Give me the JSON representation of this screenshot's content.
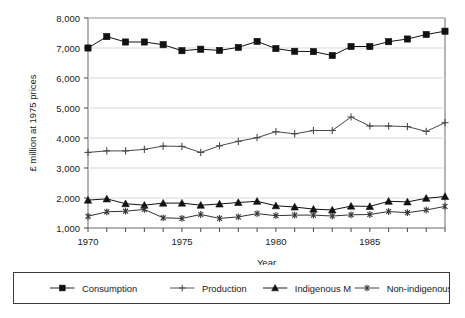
{
  "chart_data": {
    "type": "line",
    "title": "",
    "xlabel": "Year",
    "ylabel": "£ million at 1975 prices",
    "xlim": [
      1970,
      1989
    ],
    "ylim": [
      1000,
      8000
    ],
    "ytick_labels": [
      "1,000",
      "2,000",
      "3,000",
      "4,000",
      "5,000",
      "6,000",
      "7,000",
      "8,000"
    ],
    "yticks": [
      1000,
      2000,
      3000,
      4000,
      5000,
      6000,
      7000,
      8000
    ],
    "xtick_labels": [
      "1970",
      "1975",
      "1980",
      "1985"
    ],
    "xticks": [
      1970,
      1975,
      1980,
      1985
    ],
    "x": [
      1970,
      1971,
      1972,
      1973,
      1974,
      1975,
      1976,
      1977,
      1978,
      1979,
      1980,
      1981,
      1982,
      1983,
      1984,
      1985,
      1986,
      1987,
      1988,
      1989
    ],
    "grid": "horizontal",
    "legend_position": "bottom",
    "series": [
      {
        "name": "Consumption",
        "marker": "square",
        "color": "#111111",
        "values": [
          7000,
          7380,
          7200,
          7200,
          7110,
          6910,
          6960,
          6920,
          7020,
          7220,
          6980,
          6890,
          6880,
          6750,
          7050,
          7050,
          7210,
          7300,
          7450,
          7560
        ]
      },
      {
        "name": "Production",
        "marker": "plus",
        "color": "#4a4a4a",
        "values": [
          3520,
          3570,
          3570,
          3620,
          3730,
          3720,
          3520,
          3740,
          3890,
          4010,
          4210,
          4140,
          4250,
          4250,
          4700,
          4400,
          4400,
          4380,
          4220,
          4510
        ]
      },
      {
        "name": "Indigenous M",
        "marker": "triangle",
        "color": "#111111",
        "values": [
          1930,
          1970,
          1810,
          1760,
          1830,
          1830,
          1760,
          1800,
          1850,
          1890,
          1740,
          1700,
          1630,
          1600,
          1730,
          1720,
          1890,
          1870,
          1990,
          2050
        ]
      },
      {
        "name": "Non-indigenous",
        "marker": "asterisk",
        "color": "#333333",
        "values": [
          1390,
          1540,
          1560,
          1620,
          1340,
          1320,
          1450,
          1320,
          1370,
          1480,
          1410,
          1430,
          1430,
          1400,
          1440,
          1450,
          1550,
          1510,
          1600,
          1720
        ]
      }
    ]
  },
  "legend": {
    "items": [
      {
        "label": "Consumption",
        "marker": "square"
      },
      {
        "label": "Production",
        "marker": "plus"
      },
      {
        "label": "Indigenous M",
        "marker": "triangle"
      },
      {
        "label": "Non-indigenous",
        "marker": "asterisk"
      }
    ]
  }
}
